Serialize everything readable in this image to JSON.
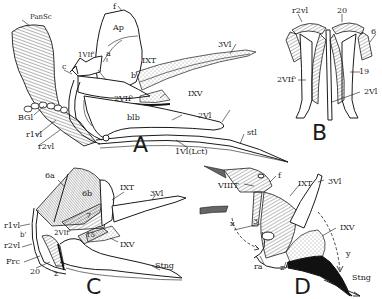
{
  "figure": {
    "panels": [
      {
        "id": "A",
        "letter": "A",
        "labels": {
          "PanSc": "PanSc",
          "f": "f",
          "Ap": "Ap",
          "c": "c",
          "a": "a",
          "1VIf": "1VIf'",
          "IXT": "IXT",
          "b": "b",
          "3Vl": "3Vl",
          "2VIf": "2VIf'",
          "IXV": "IXV",
          "BGl": "BGl",
          "blb": "blb",
          "2Vl": "2Vl",
          "r1vl": "r1vl",
          "r2vl": "r2vl",
          "stl": "stl",
          "1Vl_Lct": "1Vl(Lct)"
        }
      },
      {
        "id": "B",
        "letter": "B",
        "labels": {
          "r2vl": "r2vl",
          "20": "20",
          "6": "6",
          "2VIf": "2VIf'",
          "19": "19",
          "2Vl": "2Vl"
        }
      },
      {
        "id": "C",
        "letter": "C",
        "labels": {
          "6a": "6a",
          "6b": "6b",
          "IXT": "IXT",
          "3Vl": "3Vl",
          "7": "7",
          "r1vl": "r1vl",
          "b": "b'",
          "2VIf": "2VIf'",
          "15": "15",
          "IXV": "IXV",
          "r2vl": "r2vl",
          "Frc": "Frc",
          "20": "20",
          "z": "z",
          "Stng": "Stng"
        }
      },
      {
        "id": "D",
        "letter": "D",
        "labels": {
          "VIIIT": "VIIIT",
          "f": "f",
          "IXT": "IXT",
          "3Vl": "3Vl",
          "x": "x",
          "3": "3",
          "IXV": "IXV",
          "y": "y",
          "ra": "ra",
          "z": "z",
          "Stng": "Stng"
        }
      }
    ]
  }
}
